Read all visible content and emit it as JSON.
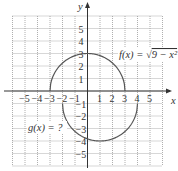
{
  "chart_data": {
    "type": "line",
    "title": "",
    "xlabel": "x",
    "ylabel": "y",
    "xlim": [
      -6,
      6
    ],
    "ylim": [
      -6,
      6
    ],
    "grid": true,
    "x_ticks": [
      "-5",
      "-4",
      "-3",
      "-2",
      "-1",
      "1",
      "2",
      "3",
      "4",
      "5"
    ],
    "y_ticks": [
      "5",
      "4",
      "3",
      "2",
      "1",
      "-1",
      "-2",
      "-3",
      "-4",
      "-5"
    ],
    "series": [
      {
        "name": "f(x) = √(9 − x²)",
        "label": "f(x) = √9 − x²",
        "description": "upper semicircle centered at (0,0), radius 3",
        "domain": [
          -3,
          3
        ],
        "points": [
          [
            -3,
            0
          ],
          [
            -2,
            2.24
          ],
          [
            -1,
            2.83
          ],
          [
            0,
            3
          ],
          [
            1,
            2.83
          ],
          [
            2,
            2.24
          ],
          [
            3,
            0
          ]
        ]
      },
      {
        "name": "g(x) = ?",
        "label": "g(x) = ?",
        "description": "lower semicircle centered at (1,-1), radius 3",
        "domain": [
          -2,
          4
        ],
        "points": [
          [
            -2,
            -1
          ],
          [
            -1,
            -3.24
          ],
          [
            0,
            -3.83
          ],
          [
            1,
            -4
          ],
          [
            2,
            -3.83
          ],
          [
            3,
            -3.24
          ],
          [
            4,
            -1
          ]
        ]
      }
    ]
  },
  "labels": {
    "x_axis": "x",
    "y_axis": "y",
    "f_label": "f(x) = √9 − x²",
    "g_label": "g(x) = ?"
  }
}
